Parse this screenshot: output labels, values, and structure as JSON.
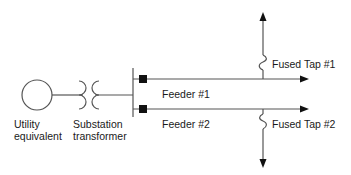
{
  "diagram": {
    "type": "single-line distribution feeder schematic",
    "colors": {
      "line": "#555555",
      "fill": "#111111",
      "text": "#1a1a1a"
    },
    "components": {
      "source": {
        "icon": "ac-source-circle-icon",
        "label_line1": "Utility",
        "label_line2": "equivalent"
      },
      "transformer": {
        "icon": "transformer-coils-icon",
        "label_line1": "Substation",
        "label_line2": "transformer"
      },
      "bus": {
        "icon": "bus-bar-icon"
      },
      "feeders": [
        {
          "label": "Feeder #1",
          "breaker_icon": "breaker-square-icon",
          "end_icon": "arrow-right-icon"
        },
        {
          "label": "Feeder #2",
          "breaker_icon": "breaker-square-icon",
          "end_icon": "arrow-right-icon"
        }
      ],
      "taps": [
        {
          "label": "Fused Tap #1",
          "fuse_icon": "fuse-icon",
          "end_icon": "arrow-up-icon",
          "from_feeder": "Feeder #1"
        },
        {
          "label": "Fused Tap #2",
          "fuse_icon": "fuse-icon",
          "end_icon": "arrow-down-icon",
          "from_feeder": "Feeder #2"
        }
      ]
    }
  }
}
